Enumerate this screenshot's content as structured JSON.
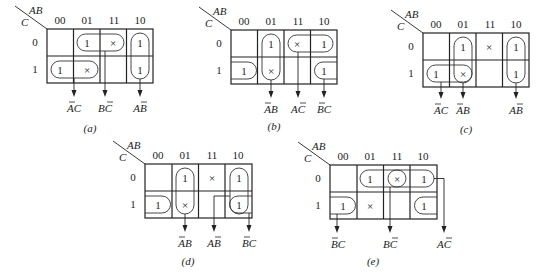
{
  "figure": {
    "col_header_var": "AB",
    "row_header_var": "C",
    "col_labels": [
      "00",
      "01",
      "11",
      "10"
    ],
    "row_labels": [
      "0",
      "1"
    ],
    "maps": [
      {
        "id": "a",
        "caption": "(a)",
        "cells": [
          [
            "",
            "1",
            "×",
            "1"
          ],
          [
            "1",
            "×",
            "",
            "1"
          ]
        ],
        "terms": [
          {
            "text": "AC",
            "overbar": "A"
          },
          {
            "text": "BC",
            "overbar": "C"
          },
          {
            "text": "AB",
            "overbar": "B"
          }
        ]
      },
      {
        "id": "b",
        "caption": "(b)",
        "cells": [
          [
            "",
            "1",
            "×",
            "1"
          ],
          [
            "1",
            "×",
            "",
            "1"
          ]
        ],
        "terms": [
          {
            "text": "AB",
            "overbar": "A"
          },
          {
            "text": "AC",
            "overbar": "C"
          },
          {
            "text": "BC",
            "overbar": "B"
          }
        ]
      },
      {
        "id": "c",
        "caption": "(c)",
        "cells": [
          [
            "",
            "1",
            "×",
            "1"
          ],
          [
            "1",
            "×",
            "",
            "1"
          ]
        ],
        "terms": [
          {
            "text": "AC",
            "overbar": "A"
          },
          {
            "text": "AB",
            "overbar": "A"
          },
          {
            "text": "AB",
            "overbar": "B"
          }
        ]
      },
      {
        "id": "d",
        "caption": "(d)",
        "cells": [
          [
            "",
            "1",
            "×",
            "1"
          ],
          [
            "1",
            "×",
            "",
            "1"
          ]
        ],
        "terms": [
          {
            "text": "AB",
            "overbar": "A"
          },
          {
            "text": "AB",
            "overbar": "B"
          },
          {
            "text": "BC",
            "overbar": "B"
          }
        ]
      },
      {
        "id": "e",
        "caption": "(e)",
        "cells": [
          [
            "",
            "1",
            "×",
            "1"
          ],
          [
            "1",
            "×",
            "",
            "1"
          ]
        ],
        "terms": [
          {
            "text": "BC",
            "overbar": "B"
          },
          {
            "text": "BC",
            "overbar": "C"
          },
          {
            "text": "AC",
            "overbar": "C"
          }
        ]
      }
    ]
  }
}
